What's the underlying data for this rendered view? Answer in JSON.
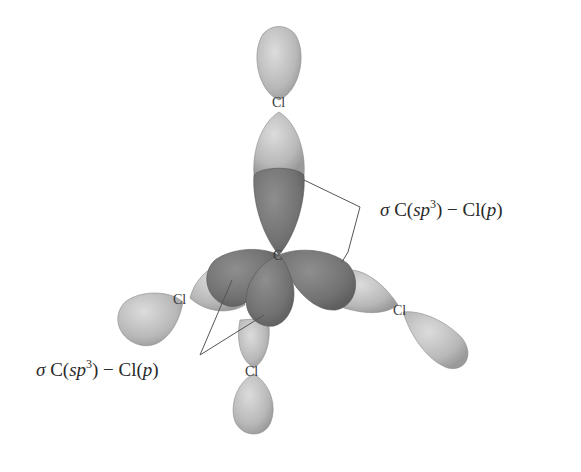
{
  "diagram": {
    "colors": {
      "background": "#ffffff",
      "cl_lobe_light": "#c9c9c9",
      "cl_lobe_mid": "#a9a9a9",
      "c_sp3_lobe": "#7d7d7d",
      "c_sp3_lobe_dark": "#6a6a6a",
      "leader_line": "#555555",
      "text": "#2a2a2a"
    },
    "atoms": {
      "center": "C",
      "top": "Cl",
      "left": "Cl",
      "right": "Cl",
      "bottom": "Cl"
    },
    "labels": [
      {
        "id": "upper-right",
        "sigma": "σ",
        "prefix": "C(",
        "orbital": "sp",
        "superscript": "3",
        "middle": ") − Cl(",
        "p": "p",
        "suffix": ")"
      },
      {
        "id": "lower-left",
        "sigma": "σ",
        "prefix": "C(",
        "orbital": "sp",
        "superscript": "3",
        "middle": ") − Cl(",
        "p": "p",
        "suffix": ")"
      }
    ]
  }
}
